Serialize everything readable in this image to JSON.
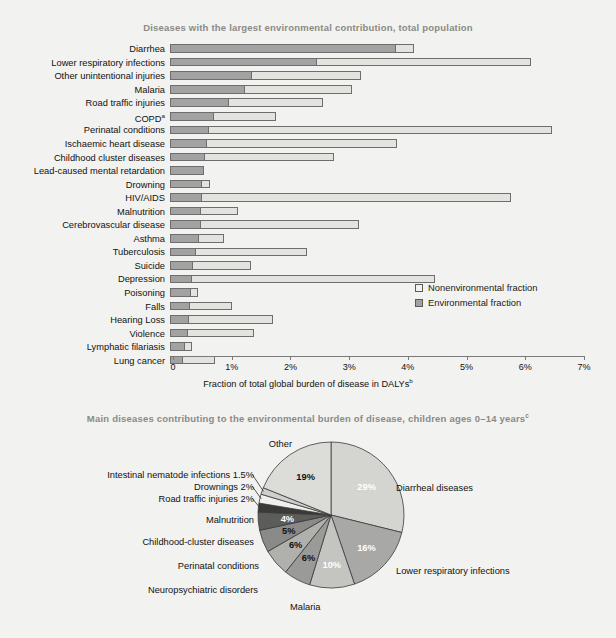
{
  "bar_panel": {
    "title": "Diseases with the largest environmental contribution, total population",
    "x_axis_title": "Fraction of total global burden of disease in DALYs",
    "x_axis_title_sup": "b",
    "legend": {
      "nonenvironmental": "Nonenvironmental fraction",
      "environmental": "Environmental fraction"
    },
    "ticks": [
      "0",
      "1%",
      "2%",
      "3%",
      "4%",
      "5%",
      "6%",
      "7%"
    ]
  },
  "pie_panel": {
    "title": "Main diseases contributing to the environmental burden of disease, children ages 0–14 years",
    "title_sup": "c"
  },
  "colors": {
    "environmental_fill": "#a2a2a2",
    "nonenvironmental_fill": "#e3e3e0",
    "outline": "#6e6e6e",
    "title_gray": "#8b8b86",
    "background": "#f2f2f0"
  },
  "chart_data": [
    {
      "type": "bar",
      "orientation": "horizontal",
      "stacked": true,
      "title": "Diseases with the largest environmental contribution, total population",
      "xlabel": "Fraction of total global burden of disease in DALYs",
      "ylabel": "",
      "xlim": [
        0,
        7
      ],
      "xunit": "%",
      "grid": false,
      "legend_position": "center-right",
      "categories": [
        "Diarrhea",
        "Lower respiratory infections",
        "Other unintentional injuries",
        "Malaria",
        "Road traffic injuries",
        "COPD",
        "Perinatal conditions",
        "Ischaemic heart disease",
        "Childhood cluster diseases",
        "Lead-caused mental retardation",
        "Drowning",
        "HIV/AIDS",
        "Malnutrition",
        "Cerebrovascular disease",
        "Asthma",
        "Tuberculosis",
        "Suicide",
        "Depression",
        "Poisoning",
        "Falls",
        "Hearing Loss",
        "Violence",
        "Lymphatic filariasis",
        "Lung cancer"
      ],
      "category_sup": {
        "COPD": "a"
      },
      "series": [
        {
          "name": "Environmental fraction",
          "values": [
            3.85,
            2.5,
            1.4,
            1.27,
            1.0,
            0.75,
            0.66,
            0.63,
            0.6,
            0.58,
            0.55,
            0.54,
            0.52,
            0.52,
            0.5,
            0.45,
            0.4,
            0.38,
            0.36,
            0.34,
            0.32,
            0.3,
            0.25,
            0.22
          ]
        },
        {
          "name": "Nonenvironmental fraction",
          "values": [
            0.3,
            3.65,
            1.85,
            1.83,
            1.6,
            1.05,
            5.84,
            3.24,
            2.2,
            0.0,
            0.13,
            5.26,
            0.63,
            2.7,
            0.42,
            1.88,
            0.98,
            4.14,
            0.11,
            0.72,
            1.43,
            1.13,
            0.13,
            0.55
          ]
        }
      ],
      "totals": [
        4.15,
        6.15,
        3.25,
        3.1,
        2.6,
        1.8,
        6.5,
        3.87,
        2.8,
        0.58,
        0.68,
        5.8,
        1.15,
        3.22,
        0.92,
        2.33,
        1.38,
        4.52,
        0.47,
        1.06,
        1.75,
        1.43,
        0.38,
        0.77
      ]
    },
    {
      "type": "pie",
      "title": "Main diseases contributing to the environmental burden of disease, children ages 0–14 years",
      "labels": [
        "Diarrheal diseases",
        "Lower respiratory infections",
        "Malaria",
        "Neuropsychiatric disorders",
        "Perinatal conditions",
        "Childhood-cluster diseases",
        "Malnutrition",
        "Road traffic injuries",
        "Drownings",
        "Intestinal nematode infections",
        "Other"
      ],
      "values": [
        29,
        16,
        10,
        6,
        6,
        5,
        4,
        2,
        2,
        1.5,
        19
      ],
      "value_labels": [
        "29%",
        "16%",
        "10%",
        "6%",
        "6%",
        "5%",
        "4%",
        "2%",
        "2%",
        "1.5%",
        "19%"
      ],
      "callout_labels": [
        "Diarrheal diseases",
        "Lower respiratory infections",
        "Malaria",
        "Neuropsychiatric disorders",
        "Perinatal conditions",
        "Childhood-cluster diseases",
        "Malnutrition",
        "Road traffic injuries 2%",
        "Drownings 2%",
        "Intestinal nematode infections 1.5%",
        "Other"
      ],
      "slice_colors": [
        "#d4d4d1",
        "#a8a8a6",
        "#c4c4c1",
        "#9a9a98",
        "#b0b0ad",
        "#8a8a88",
        "#5c5c5a",
        "#3a3a39",
        "#f0f0ee",
        "#cfcfcc",
        "#dcdcd9"
      ],
      "start_angle_deg": 0,
      "direction": "clockwise",
      "legend_position": "callouts"
    }
  ]
}
